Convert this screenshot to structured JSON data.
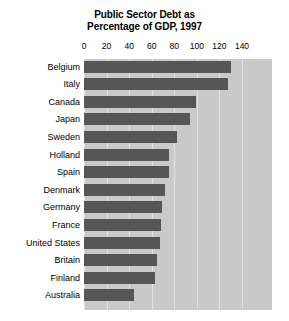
{
  "chart_data": {
    "type": "bar",
    "orientation": "horizontal",
    "title": "Public Sector Debt as Percentage of GDP, 1997",
    "title_lines": [
      "Public Sector Debt as",
      "Percentage of GDP, 1997"
    ],
    "xlabel": "",
    "ylabel": "",
    "xlim": [
      0,
      150
    ],
    "xticks": [
      0,
      20,
      40,
      60,
      80,
      100,
      120,
      140
    ],
    "xtick_labels": [
      "0",
      "20",
      "40",
      "60",
      "80",
      "100",
      "120",
      "140"
    ],
    "grid": true,
    "grid_axis": "x",
    "legend": false,
    "categories": [
      "Belgium",
      "Italy",
      "Canada",
      "Japan",
      "Sweden",
      "Holland",
      "Spain",
      "Denmark",
      "Germany",
      "France",
      "United States",
      "Britain",
      "Finland",
      "Australia"
    ],
    "values": [
      130,
      128,
      99,
      94,
      82,
      75,
      75,
      72,
      69,
      68,
      67,
      65,
      63,
      44
    ],
    "series": [
      {
        "name": "Public sector debt (% of GDP)",
        "values": [
          130,
          128,
          99,
          94,
          82,
          75,
          75,
          72,
          69,
          68,
          67,
          65,
          63,
          44
        ]
      }
    ],
    "colors": {
      "bar": "#565656",
      "plot_background": "#c9c9c9",
      "gridline": "#e2e2e2",
      "text": "#000000",
      "page_background": "#ffffff"
    }
  }
}
